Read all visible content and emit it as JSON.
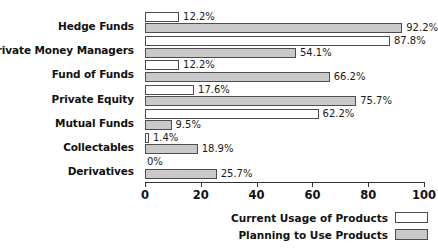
{
  "chart_data": {
    "type": "bar",
    "orientation": "horizontal",
    "title": "",
    "xlabel": "",
    "ylabel": "",
    "xlim": [
      0,
      100
    ],
    "xticks": [
      0,
      20,
      40,
      60,
      80,
      100
    ],
    "xtick_labels": [
      "0",
      "20",
      "40",
      "60",
      "80",
      "100"
    ],
    "grid": false,
    "legend_position": "bottom-right",
    "categories": [
      "Hedge Funds",
      "Private Money Managers",
      "Fund of Funds",
      "Private Equity",
      "Mutual Funds",
      "Collectables",
      "Derivatives"
    ],
    "series": [
      {
        "name": "Current Usage of Products",
        "color": "#ffffff",
        "values": [
          12.2,
          87.8,
          12.2,
          17.6,
          62.2,
          1.4,
          0
        ],
        "labels": [
          "12.2%",
          "87.8%",
          "12.2%",
          "17.6%",
          "62.2%",
          "1.4%",
          "0%"
        ]
      },
      {
        "name": "Planning to Use Products",
        "color": "#c9c9c9",
        "values": [
          92.2,
          54.1,
          66.2,
          75.7,
          9.5,
          18.9,
          25.7
        ],
        "labels": [
          "92.2%",
          "54.1%",
          "66.2%",
          "75.7%",
          "9.5%",
          "18.9%",
          "25.7%"
        ]
      }
    ]
  },
  "legend": {
    "items": [
      {
        "label": "Current Usage of Products",
        "swatch": "current"
      },
      {
        "label": "Planning to Use Products",
        "swatch": "planning"
      }
    ]
  }
}
